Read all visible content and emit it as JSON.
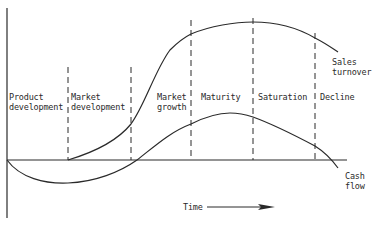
{
  "diagram": {
    "type": "product-life-cycle",
    "stages": [
      {
        "line1": "Product",
        "line2": "development"
      },
      {
        "line1": "Market",
        "line2": "development"
      },
      {
        "line1": "Market",
        "line2": "growth"
      },
      {
        "line1": "Maturity",
        "line2": ""
      },
      {
        "line1": "Saturation",
        "line2": ""
      },
      {
        "line1": "Decline",
        "line2": ""
      }
    ],
    "curves": {
      "sales": {
        "line1": "Sales",
        "line2": "turnover"
      },
      "cash": {
        "line1": "Cash",
        "line2": "flow"
      }
    },
    "x_axis_label": "Time",
    "colors": {
      "ink": "#2a2a2a",
      "background": "#ffffff"
    }
  }
}
